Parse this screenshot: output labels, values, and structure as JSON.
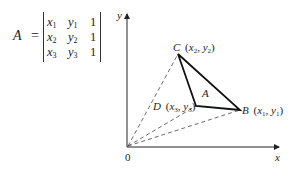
{
  "equation": {
    "lhs_variable": "A",
    "equals": "=",
    "matrix": {
      "type": "determinant",
      "rows": [
        [
          {
            "var": "x",
            "sub": "1"
          },
          {
            "var": "y",
            "sub": "1"
          },
          {
            "val": "1"
          }
        ],
        [
          {
            "var": "x",
            "sub": "2"
          },
          {
            "var": "y",
            "sub": "2"
          },
          {
            "val": "1"
          }
        ],
        [
          {
            "var": "x",
            "sub": "3"
          },
          {
            "var": "y",
            "sub": "3"
          },
          {
            "val": "1"
          }
        ]
      ]
    }
  },
  "diagram": {
    "axes": {
      "x_label": "x",
      "y_label": "y",
      "origin_label": "0"
    },
    "points": {
      "B": {
        "name": "B",
        "coord_label": "(x1, y1)",
        "x_var": "x",
        "x_sub": "1",
        "y_var": "y",
        "y_sub": "1"
      },
      "C": {
        "name": "C",
        "coord_label": "(x2, y2)",
        "x_var": "x",
        "x_sub": "2",
        "y_var": "y",
        "y_sub": "2"
      },
      "D": {
        "name": "D",
        "coord_label": "(x3, y3)",
        "x_var": "x",
        "x_sub": "3",
        "y_var": "y",
        "y_sub": "3"
      }
    },
    "triangle_label": "A",
    "line_color": "#222222",
    "dashed_color": "#444444"
  }
}
